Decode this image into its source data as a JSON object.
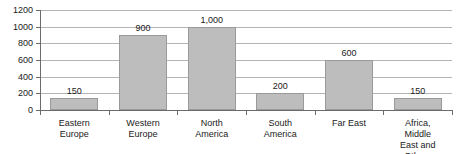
{
  "chart_data": {
    "type": "bar",
    "title": "",
    "xlabel": "",
    "ylabel": "",
    "ylim": [
      0,
      1200
    ],
    "ytick_step": 200,
    "grid": true,
    "legend": null,
    "bar_color": "#bdbdbd",
    "bar_border_color": "#9a9a9a",
    "axis_color": "#6b6b6b",
    "grid_color": "#b4b4b4",
    "text_color": "#1a1a1a",
    "categories": [
      "Eastern\nEurope",
      "Western\nEurope",
      "North\nAmerica",
      "South\nAmerica",
      "Far East",
      "Africa, Middle\nEast and Others"
    ],
    "values": [
      150,
      900,
      1000,
      200,
      600,
      150
    ],
    "value_labels": [
      "150",
      "900",
      "1,000",
      "200",
      "600",
      "150"
    ],
    "ytick_labels": [
      "0",
      "200",
      "400",
      "600",
      "800",
      "1000",
      "1200"
    ],
    "ytick_values": [
      0,
      200,
      400,
      600,
      800,
      1000,
      1200
    ]
  }
}
